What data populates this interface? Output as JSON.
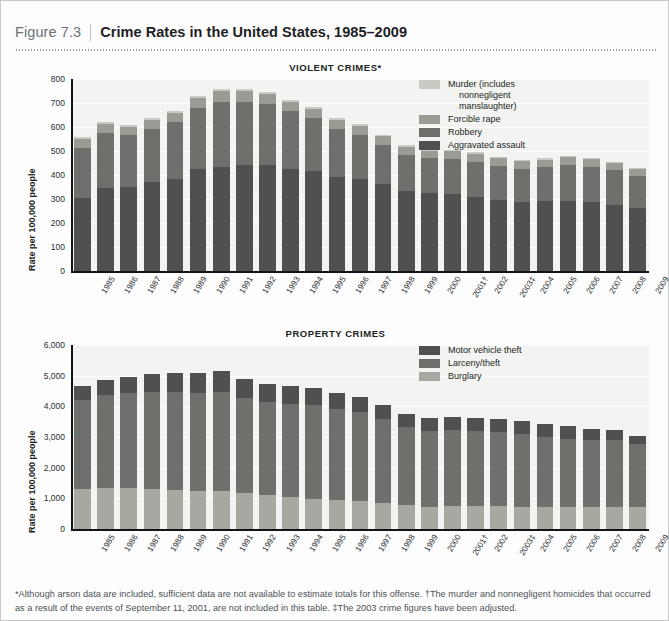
{
  "header": {
    "figure_number": "Figure 7.3",
    "title": "Crime Rates in the United States, 1985–2009"
  },
  "footnote": "*Although arson data are included, sufficient data are not available to estimate totals for this offense. †The murder and nonnegligent homicides that occurred as a result of the events of September 11, 2001, are not included in this table. ‡The 2003 crime figures have been adjusted.",
  "colors": {
    "panel_bg": "#f3f3f1",
    "gridline": "#ffffff",
    "axis": "#111417",
    "violent_murder": "#c9cac4",
    "violent_forcible_rape": "#9a9b95",
    "violent_robbery": "#6e706b",
    "violent_aggravated_assault": "#4e5150",
    "property_motor_vehicle_theft": "#4e5150",
    "property_larceny_theft": "#6e706b",
    "property_burglary": "#a7a8a2"
  },
  "chart_data": [
    {
      "type": "bar",
      "stacked": true,
      "title": "VIOLENT CRIMES*",
      "xlabel": "",
      "ylabel": "Rate per 100,000 people",
      "ylim": [
        0,
        800
      ],
      "yticks": [
        0,
        100,
        200,
        300,
        400,
        500,
        600,
        700,
        800
      ],
      "ytick_labels": [
        "0",
        "100",
        "200",
        "300",
        "400",
        "500",
        "600",
        "700",
        "800"
      ],
      "grid": true,
      "legend_position": "top-right",
      "categories": [
        "1985",
        "1986",
        "1987",
        "1988",
        "1989",
        "1990",
        "1991",
        "1992",
        "1993",
        "1994",
        "1995",
        "1996",
        "1997",
        "1998",
        "1999",
        "2000",
        "2001†",
        "2002",
        "2003‡",
        "2004",
        "2005",
        "2006",
        "2007",
        "2008",
        "2009"
      ],
      "series": [
        {
          "name": "Aggravated assault",
          "color": "#4e5150",
          "values": [
            303,
            347,
            352,
            372,
            385,
            424,
            433,
            442,
            440,
            427,
            418,
            391,
            382,
            361,
            334,
            324,
            319,
            310,
            295,
            289,
            291,
            292,
            287,
            275,
            263
          ]
        },
        {
          "name": "Robbery",
          "color": "#6e706b",
          "values": [
            209,
            226,
            213,
            221,
            234,
            257,
            273,
            264,
            256,
            238,
            221,
            202,
            186,
            166,
            150,
            145,
            149,
            146,
            142,
            137,
            141,
            150,
            148,
            145,
            133
          ]
        },
        {
          "name": "Forcible rape",
          "color": "#9a9b95",
          "values": [
            37,
            38,
            37,
            38,
            38,
            41,
            42,
            43,
            41,
            39,
            37,
            36,
            36,
            34,
            33,
            32,
            32,
            33,
            32,
            32,
            32,
            31,
            30,
            30,
            29
          ]
        },
        {
          "name": "Murder (includes nonnegligent manslaughter)",
          "color": "#c9cac4",
          "values": [
            8,
            9,
            8,
            8,
            9,
            9,
            10,
            9,
            10,
            9,
            8,
            7,
            7,
            6,
            6,
            6,
            6,
            6,
            6,
            5,
            6,
            6,
            6,
            5,
            5
          ]
        }
      ],
      "totals": [
        557,
        620,
        610,
        639,
        666,
        731,
        758,
        758,
        747,
        713,
        684,
        636,
        611,
        567,
        523,
        507,
        506,
        495,
        475,
        463,
        470,
        479,
        471,
        455,
        430
      ]
    },
    {
      "type": "bar",
      "stacked": true,
      "title": "PROPERTY CRIMES",
      "xlabel": "",
      "ylabel": "Rate per 100,000 people",
      "ylim": [
        0,
        6000
      ],
      "yticks": [
        0,
        1000,
        2000,
        3000,
        4000,
        5000,
        6000
      ],
      "ytick_labels": [
        "0",
        "1,000",
        "2,000",
        "3,000",
        "4,000",
        "5,000",
        "6,000"
      ],
      "grid": true,
      "legend_position": "top-right",
      "categories": [
        "1985",
        "1986",
        "1987",
        "1988",
        "1989",
        "1990",
        "1991",
        "1992",
        "1993",
        "1994",
        "1995",
        "1996",
        "1997",
        "1998",
        "1999",
        "2000",
        "2001†",
        "2002",
        "2003‡",
        "2004",
        "2005",
        "2006",
        "2007",
        "2008",
        "2009"
      ],
      "series": [
        {
          "name": "Burglary",
          "color": "#a7a8a2",
          "values": [
            1292,
            1350,
            1335,
            1316,
            1284,
            1236,
            1252,
            1169,
            1100,
            1042,
            987,
            945,
            919,
            863,
            770,
            729,
            741,
            747,
            741,
            730,
            727,
            733,
            722,
            733,
            716
          ]
        },
        {
          "name": "Larceny/theft",
          "color": "#6e706b",
          "values": [
            2901,
            3010,
            3095,
            3151,
            3189,
            3195,
            3229,
            3104,
            3033,
            3026,
            3043,
            2980,
            2891,
            2729,
            2551,
            2477,
            2486,
            2451,
            2416,
            2362,
            2287,
            2213,
            2185,
            2167,
            2061
          ]
        },
        {
          "name": "Motor vehicle theft",
          "color": "#4e5150",
          "values": [
            462,
            508,
            529,
            583,
            630,
            657,
            659,
            632,
            606,
            591,
            560,
            526,
            506,
            460,
            422,
            412,
            431,
            432,
            433,
            422,
            417,
            400,
            364,
            315,
            259
          ]
        }
      ],
      "totals": [
        4655,
        4868,
        4959,
        5050,
        5103,
        5088,
        5140,
        4905,
        4739,
        4659,
        4590,
        4451,
        4316,
        4052,
        3743,
        3618,
        3658,
        3630,
        3590,
        3514,
        3431,
        3346,
        3271,
        3215,
        3036
      ]
    }
  ]
}
